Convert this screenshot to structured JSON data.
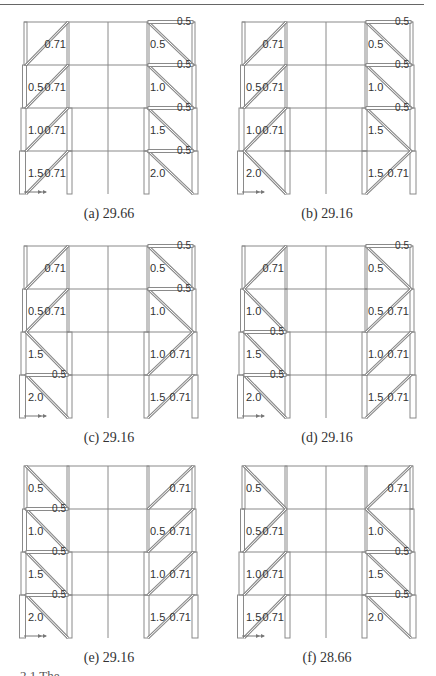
{
  "figure": {
    "panels": [
      {
        "id": "a",
        "caption": "(a) 29.66",
        "left": 0,
        "top": 8,
        "stories": [
          {
            "left": {
              "brace": "/",
              "labels": [
                "0.71"
              ]
            },
            "right": {
              "brace": "\\",
              "labels": [
                "0.5"
              ],
              "beam": "0.5"
            }
          },
          {
            "left": {
              "brace": "/",
              "labels": [
                "0.5",
                "0.71"
              ]
            },
            "right": {
              "brace": "\\",
              "labels": [
                "1.0"
              ],
              "beam": "0.5"
            }
          },
          {
            "left": {
              "brace": "/",
              "labels": [
                "1.0",
                "0.71"
              ]
            },
            "right": {
              "brace": "\\",
              "labels": [
                "1.5"
              ],
              "beam": "0.5"
            }
          },
          {
            "left": {
              "brace": "/",
              "labels": [
                "1.5",
                "0.71"
              ]
            },
            "right": {
              "brace": "\\",
              "labels": [
                "2.0"
              ],
              "beam": "0.5"
            }
          }
        ]
      },
      {
        "id": "b",
        "caption": "(b) 29.16",
        "left": 218,
        "top": 8,
        "stories": [
          {
            "left": {
              "brace": "/",
              "labels": [
                "0.71"
              ]
            },
            "right": {
              "brace": "\\",
              "labels": [
                "0.5"
              ],
              "beam": "0.5"
            }
          },
          {
            "left": {
              "brace": "/",
              "labels": [
                "0.5",
                "0.71"
              ]
            },
            "right": {
              "brace": "\\",
              "labels": [
                "1.0"
              ],
              "beam": "0.5"
            }
          },
          {
            "left": {
              "brace": "/",
              "labels": [
                "1.0",
                "0.71"
              ]
            },
            "right": {
              "brace": "\\",
              "labels": [
                "1.5"
              ],
              "beam": "0.5"
            }
          },
          {
            "left": {
              "brace": "\\",
              "labels": [
                "2.0"
              ]
            },
            "right": {
              "brace": "/",
              "labels": [
                "1.5",
                "0.71"
              ]
            }
          }
        ]
      },
      {
        "id": "c",
        "caption": "(c) 29.16",
        "left": 0,
        "top": 232,
        "stories": [
          {
            "left": {
              "brace": "/",
              "labels": [
                "0.71"
              ]
            },
            "right": {
              "brace": "\\",
              "labels": [
                "0.5"
              ],
              "beam": "0.5"
            }
          },
          {
            "left": {
              "brace": "/",
              "labels": [
                "0.5",
                "0.71"
              ]
            },
            "right": {
              "brace": "\\",
              "labels": [
                "1.0"
              ],
              "beam": "0.5"
            }
          },
          {
            "left": {
              "brace": "\\",
              "labels": [
                "1.5"
              ]
            },
            "right": {
              "brace": "/",
              "labels": [
                "1.0",
                "0.71"
              ]
            }
          },
          {
            "left": {
              "brace": "\\",
              "labels": [
                "2.0"
              ],
              "beam": "0.5"
            },
            "right": {
              "brace": "/",
              "labels": [
                "1.5",
                "0.71"
              ]
            }
          }
        ]
      },
      {
        "id": "d",
        "caption": "(d) 29.16",
        "left": 218,
        "top": 232,
        "stories": [
          {
            "left": {
              "brace": "/",
              "labels": [
                "0.71"
              ]
            },
            "right": {
              "brace": "\\",
              "labels": [
                "0.5"
              ],
              "beam": "0.5"
            }
          },
          {
            "left": {
              "brace": "\\",
              "labels": [
                "1.0"
              ]
            },
            "right": {
              "brace": "/",
              "labels": [
                "0.5",
                "0.71"
              ]
            }
          },
          {
            "left": {
              "brace": "\\",
              "labels": [
                "1.5"
              ],
              "beam": "0.5"
            },
            "right": {
              "brace": "/",
              "labels": [
                "1.0",
                "0.71"
              ]
            }
          },
          {
            "left": {
              "brace": "\\",
              "labels": [
                "2.0"
              ],
              "beam": "0.5"
            },
            "right": {
              "brace": "/",
              "labels": [
                "1.5",
                "0.71"
              ]
            }
          }
        ]
      },
      {
        "id": "e",
        "caption": "(e) 29.16",
        "left": 0,
        "top": 452,
        "stories": [
          {
            "left": {
              "brace": "\\",
              "labels": [
                "0.5"
              ]
            },
            "right": {
              "brace": "/",
              "labels": [
                "0.71"
              ]
            }
          },
          {
            "left": {
              "brace": "\\",
              "labels": [
                "1.0"
              ],
              "beam": "0.5"
            },
            "right": {
              "brace": "/",
              "labels": [
                "0.5",
                "0.71"
              ]
            }
          },
          {
            "left": {
              "brace": "\\",
              "labels": [
                "1.5"
              ],
              "beam": "0.5"
            },
            "right": {
              "brace": "/",
              "labels": [
                "1.0",
                "0.71"
              ]
            }
          },
          {
            "left": {
              "brace": "\\",
              "labels": [
                "2.0"
              ],
              "beam": "0.5"
            },
            "right": {
              "brace": "/",
              "labels": [
                "1.5",
                "0.71"
              ]
            }
          }
        ]
      },
      {
        "id": "f",
        "caption": "(f) 28.66",
        "left": 218,
        "top": 452,
        "stories": [
          {
            "left": {
              "brace": "\\",
              "labels": [
                "0.5"
              ]
            },
            "right": {
              "brace": "/",
              "labels": [
                "0.71"
              ]
            }
          },
          {
            "left": {
              "brace": "/",
              "labels": [
                "0.5",
                "0.71"
              ]
            },
            "right": {
              "brace": "\\",
              "labels": [
                "1.0"
              ]
            }
          },
          {
            "left": {
              "brace": "/",
              "labels": [
                "1.0",
                "0.71"
              ]
            },
            "right": {
              "brace": "\\",
              "labels": [
                "1.5"
              ],
              "beam": "0.5"
            }
          },
          {
            "left": {
              "brace": "/",
              "labels": [
                "1.5",
                "0.71"
              ]
            },
            "right": {
              "brace": "\\",
              "labels": [
                "2.0"
              ],
              "beam": "0.5"
            }
          }
        ]
      }
    ],
    "footer_caption_partial": "2.1 The ..."
  },
  "colors": {
    "frame": "#8a8a8a",
    "frame_light": "#b5b5b5",
    "text": "#333333"
  }
}
